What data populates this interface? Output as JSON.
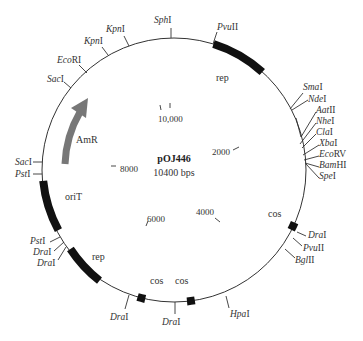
{
  "plasmid": {
    "name": "pOJ446",
    "size_label": "10400 bps"
  },
  "colors": {
    "backbone": "#333333",
    "feature_block": "#111111",
    "arrow": "#777777"
  },
  "scale_ticks": [
    {
      "label": "2000",
      "x": 237,
      "y": 185
    },
    {
      "label": "4000",
      "x": 196,
      "y": 216
    },
    {
      "label": "6000",
      "x": 147,
      "y": 222
    },
    {
      "label": "8000",
      "x": 120,
      "y": 172
    },
    {
      "label": "10,000",
      "x": 158,
      "y": 122
    }
  ],
  "features": [
    {
      "label": "rep",
      "x": 216,
      "y": 81
    },
    {
      "label": "AmR",
      "x": 76,
      "y": 143
    },
    {
      "label": "oriT",
      "x": 65,
      "y": 200
    },
    {
      "label": "rep",
      "x": 92,
      "y": 260
    },
    {
      "label": "cos",
      "x": 150,
      "y": 284
    },
    {
      "label": "cos",
      "x": 175,
      "y": 284
    },
    {
      "label": "cos",
      "x": 268,
      "y": 217
    }
  ],
  "sites": [
    {
      "italic": "Sph",
      "roman": "I",
      "x": 154,
      "y": 23
    },
    {
      "italic": "Pvu",
      "roman": "II",
      "x": 217,
      "y": 28
    },
    {
      "italic": "Kpn",
      "roman": "I",
      "x": 106,
      "y": 32
    },
    {
      "italic": "Kpn",
      "roman": "I",
      "x": 84,
      "y": 44
    },
    {
      "italic": "Eco",
      "roman": "RI",
      "x": 57,
      "y": 63
    },
    {
      "italic": "Sac",
      "roman": "I",
      "x": 47,
      "y": 82
    },
    {
      "italic": "Sma",
      "roman": "I",
      "x": 312,
      "y": 88
    },
    {
      "italic": "Nde",
      "roman": "I",
      "x": 316,
      "y": 99
    },
    {
      "italic": "Aat",
      "roman": "II",
      "x": 318,
      "y": 109
    },
    {
      "italic": "Nhe",
      "roman": "I",
      "x": 318,
      "y": 120
    },
    {
      "italic": "Cla",
      "roman": "I",
      "x": 318,
      "y": 131
    },
    {
      "italic": "Xba",
      "roman": "I",
      "x": 321,
      "y": 142
    },
    {
      "italic": "Eco",
      "roman": "RV",
      "x": 321,
      "y": 153
    },
    {
      "italic": "Bam",
      "roman": "HI",
      "x": 321,
      "y": 164
    },
    {
      "italic": "Spe",
      "roman": "I",
      "x": 321,
      "y": 175
    },
    {
      "italic": "Sac",
      "roman": "I",
      "x": 16,
      "y": 164
    },
    {
      "italic": "Pst",
      "roman": "I",
      "x": 16,
      "y": 175
    },
    {
      "italic": "Pst",
      "roman": "I",
      "x": 30,
      "y": 244
    },
    {
      "italic": "Dra",
      "roman": "I",
      "x": 33,
      "y": 255
    },
    {
      "italic": "Dra",
      "roman": "I",
      "x": 37,
      "y": 266
    },
    {
      "italic": "Dra",
      "roman": "I",
      "x": 309,
      "y": 238
    },
    {
      "italic": "Pvu",
      "roman": "II",
      "x": 304,
      "y": 251
    },
    {
      "italic": "Bgl",
      "roman": "II",
      "x": 296,
      "y": 263
    },
    {
      "italic": "Hpa",
      "roman": "I",
      "x": 230,
      "y": 317
    },
    {
      "italic": "Dra",
      "roman": "I",
      "x": 110,
      "y": 320
    },
    {
      "italic": "Dra",
      "roman": "I",
      "x": 162,
      "y": 325
    }
  ]
}
